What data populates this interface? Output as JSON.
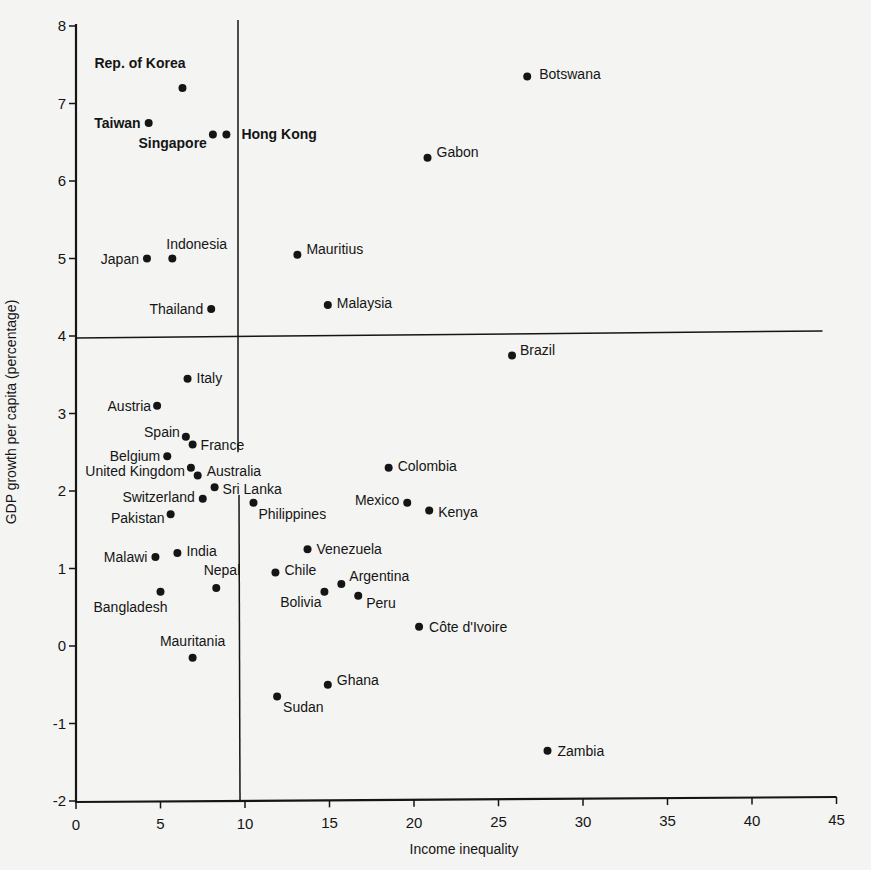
{
  "chart_data": {
    "type": "scatter",
    "title": "",
    "xlabel": "Income inequality",
    "ylabel": "GDP growth per capita (percentage)",
    "xlim": [
      0,
      45
    ],
    "ylim": [
      -2,
      8
    ],
    "xticks": [
      0,
      5,
      10,
      15,
      20,
      25,
      30,
      35,
      40,
      45
    ],
    "yticks": [
      -2,
      -1,
      0,
      1,
      2,
      3,
      4,
      5,
      6,
      7,
      8
    ],
    "grid": false,
    "legend": null,
    "reference_lines": [
      {
        "orientation": "vertical",
        "x": 10,
        "note": "quadrant divider"
      },
      {
        "orientation": "horizontal",
        "y": 4,
        "note": "quadrant divider"
      }
    ],
    "points": [
      {
        "label": "Rep. of Korea",
        "x": 6.3,
        "y": 7.2,
        "bold": true,
        "anchor": "end",
        "dx": 3,
        "dy": -20
      },
      {
        "label": "Taiwan",
        "x": 4.3,
        "y": 6.75,
        "bold": true,
        "anchor": "end",
        "dx": -8,
        "dy": 5
      },
      {
        "label": "Singapore",
        "x": 8.1,
        "y": 6.6,
        "bold": true,
        "anchor": "end",
        "dx": -6,
        "dy": 13
      },
      {
        "label": "Hong Kong",
        "x": 8.9,
        "y": 6.6,
        "bold": true,
        "anchor": "start",
        "dx": 15,
        "dy": 4
      },
      {
        "label": "Botswana",
        "x": 26.7,
        "y": 7.35,
        "bold": false,
        "anchor": "start",
        "dx": 12,
        "dy": 3
      },
      {
        "label": "Gabon",
        "x": 20.8,
        "y": 6.3,
        "bold": false,
        "anchor": "start",
        "dx": 9,
        "dy": -1
      },
      {
        "label": "Japan",
        "x": 4.2,
        "y": 5.0,
        "bold": false,
        "anchor": "end",
        "dx": -8,
        "dy": 5
      },
      {
        "label": "Indonesia",
        "x": 5.7,
        "y": 5.0,
        "bold": false,
        "anchor": "start",
        "dx": -6,
        "dy": -10
      },
      {
        "label": "Mauritius",
        "x": 13.1,
        "y": 5.05,
        "bold": false,
        "anchor": "start",
        "dx": 9,
        "dy": -1
      },
      {
        "label": "Malaysia",
        "x": 14.9,
        "y": 4.4,
        "bold": false,
        "anchor": "start",
        "dx": 9,
        "dy": 3
      },
      {
        "label": "Thailand",
        "x": 8.0,
        "y": 4.35,
        "bold": false,
        "anchor": "end",
        "dx": -8,
        "dy": 5
      },
      {
        "label": "Brazil",
        "x": 25.8,
        "y": 3.75,
        "bold": false,
        "anchor": "start",
        "dx": 8,
        "dy": 0
      },
      {
        "label": "Italy",
        "x": 6.6,
        "y": 3.45,
        "bold": false,
        "anchor": "start",
        "dx": 9,
        "dy": 4
      },
      {
        "label": "Austria",
        "x": 4.8,
        "y": 3.1,
        "bold": false,
        "anchor": "end",
        "dx": -6,
        "dy": 5
      },
      {
        "label": "Spain",
        "x": 6.5,
        "y": 2.7,
        "bold": false,
        "anchor": "end",
        "dx": -6,
        "dy": 0
      },
      {
        "label": "France",
        "x": 6.9,
        "y": 2.6,
        "bold": false,
        "anchor": "start",
        "dx": 8,
        "dy": 5
      },
      {
        "label": "Belgium",
        "x": 5.4,
        "y": 2.45,
        "bold": false,
        "anchor": "end",
        "dx": -7,
        "dy": 5
      },
      {
        "label": "United Kingdom",
        "x": 6.8,
        "y": 2.3,
        "bold": false,
        "anchor": "end",
        "dx": -6,
        "dy": 8
      },
      {
        "label": "Australia",
        "x": 7.2,
        "y": 2.2,
        "bold": false,
        "anchor": "start",
        "dx": 9,
        "dy": 0
      },
      {
        "label": "Sri Lanka",
        "x": 8.2,
        "y": 2.05,
        "bold": false,
        "anchor": "start",
        "dx": 8,
        "dy": 7
      },
      {
        "label": "Switzerland",
        "x": 7.5,
        "y": 1.9,
        "bold": false,
        "anchor": "end",
        "dx": -8,
        "dy": 3
      },
      {
        "label": "Philippines",
        "x": 10.5,
        "y": 1.85,
        "bold": false,
        "anchor": "start",
        "dx": 5,
        "dy": 16
      },
      {
        "label": "Pakistan",
        "x": 5.6,
        "y": 1.7,
        "bold": false,
        "anchor": "end",
        "dx": -6,
        "dy": 9
      },
      {
        "label": "Colombia",
        "x": 18.5,
        "y": 2.3,
        "bold": false,
        "anchor": "start",
        "dx": 9,
        "dy": 3
      },
      {
        "label": "Mexico",
        "x": 19.6,
        "y": 1.85,
        "bold": false,
        "anchor": "end",
        "dx": -8,
        "dy": 2
      },
      {
        "label": "Kenya",
        "x": 20.9,
        "y": 1.75,
        "bold": false,
        "anchor": "start",
        "dx": 9,
        "dy": 7
      },
      {
        "label": "Malawi",
        "x": 4.7,
        "y": 1.15,
        "bold": false,
        "anchor": "end",
        "dx": -8,
        "dy": 5
      },
      {
        "label": "India",
        "x": 6.0,
        "y": 1.2,
        "bold": false,
        "anchor": "start",
        "dx": 9,
        "dy": 3
      },
      {
        "label": "Venezuela",
        "x": 13.7,
        "y": 1.25,
        "bold": false,
        "anchor": "start",
        "dx": 9,
        "dy": 5
      },
      {
        "label": "Chile",
        "x": 11.8,
        "y": 0.95,
        "bold": false,
        "anchor": "start",
        "dx": 9,
        "dy": 3
      },
      {
        "label": "Argentina",
        "x": 15.7,
        "y": 0.8,
        "bold": false,
        "anchor": "start",
        "dx": 8,
        "dy": -3
      },
      {
        "label": "Bolivia",
        "x": 14.7,
        "y": 0.7,
        "bold": false,
        "anchor": "end",
        "dx": -3,
        "dy": 15
      },
      {
        "label": "Peru",
        "x": 16.7,
        "y": 0.65,
        "bold": false,
        "anchor": "start",
        "dx": 8,
        "dy": 12
      },
      {
        "label": "Nepal",
        "x": 8.3,
        "y": 0.75,
        "bold": false,
        "anchor": "end",
        "dx": 24,
        "dy": -13
      },
      {
        "label": "Bangladesh",
        "x": 5.0,
        "y": 0.7,
        "bold": false,
        "anchor": "start",
        "dx": -67,
        "dy": 20
      },
      {
        "label": "Côte d'Ivoire",
        "x": 20.3,
        "y": 0.25,
        "bold": false,
        "anchor": "start",
        "dx": 10,
        "dy": 5
      },
      {
        "label": "Mauritania",
        "x": 6.9,
        "y": -0.15,
        "bold": false,
        "anchor": "middle",
        "dx": 0,
        "dy": -12
      },
      {
        "label": "Ghana",
        "x": 14.9,
        "y": -0.5,
        "bold": false,
        "anchor": "start",
        "dx": 9,
        "dy": 0
      },
      {
        "label": "Sudan",
        "x": 11.9,
        "y": -0.65,
        "bold": false,
        "anchor": "start",
        "dx": 6,
        "dy": 16
      },
      {
        "label": "Zambia",
        "x": 27.9,
        "y": -1.35,
        "bold": false,
        "anchor": "start",
        "dx": 10,
        "dy": 5
      }
    ]
  },
  "layout": {
    "x0_px": 76,
    "px_per_x": 16.9,
    "y0_px": 646,
    "px_per_y": 77.5,
    "ink_color": "#151515",
    "background": "#f4f4f2"
  }
}
